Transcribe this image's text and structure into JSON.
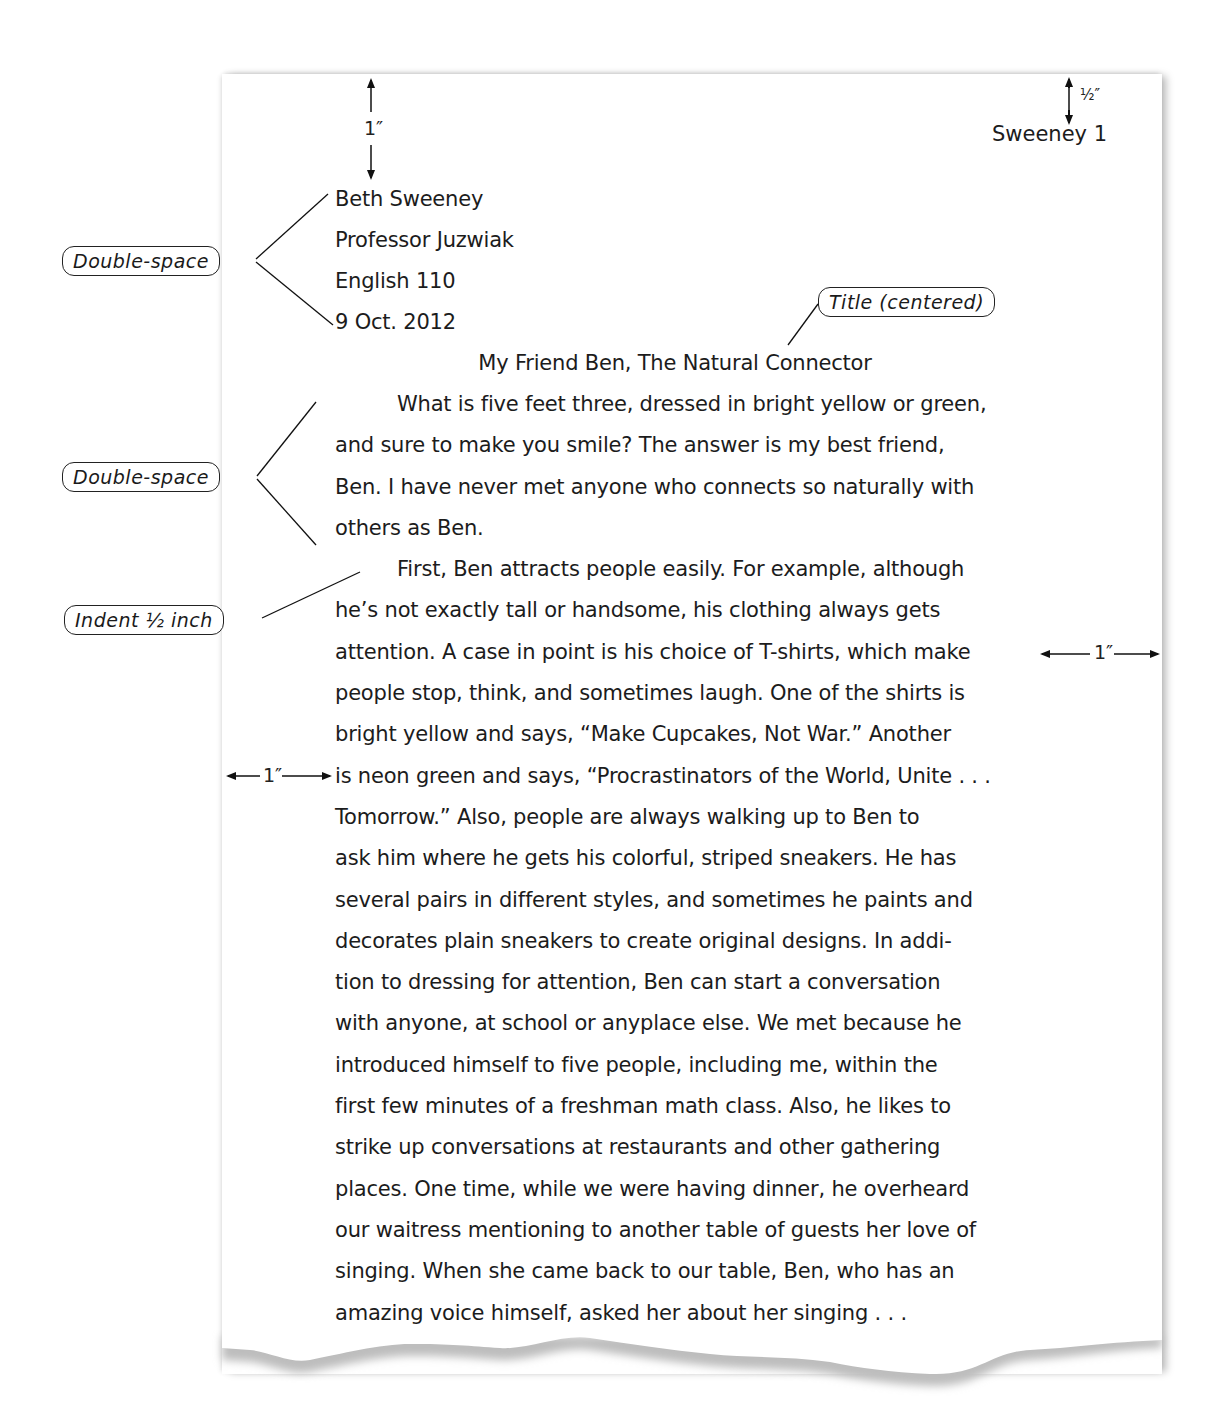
{
  "page_header": {
    "running_head": "Sweeney 1"
  },
  "heading": {
    "lines": [
      "Beth Sweeney",
      "Professor Juzwiak",
      "English 110",
      "9 Oct. 2012"
    ]
  },
  "title": "My Friend Ben, The Natural Connector",
  "body": {
    "lines": [
      "What is five feet three, dressed in bright yellow or green,",
      "and sure to make you smile? The answer is my best friend,",
      "Ben. I have never met anyone who connects so naturally with",
      "others as Ben.",
      "First, Ben attracts people easily. For example, although",
      "he’s not exactly tall or handsome, his clothing always gets",
      "attention. A case in point is his choice of T-shirts, which make",
      "people stop, think, and sometimes laugh. One of the shirts is",
      "bright yellow and says, “Make Cupcakes, Not War.” Another",
      "is neon green and says, “Procrastinators of the World, Unite . . .",
      "Tomorrow.” Also, people are always walking up to Ben to",
      "ask him where he gets his colorful, striped sneakers. He has",
      "several pairs in different styles, and sometimes he paints and",
      "decorates plain sneakers to create original designs. In addi-",
      "tion to dressing for attention, Ben can start a conversation",
      "with anyone, at school or anyplace else. We met because he",
      "introduced himself to five people, including me, within the",
      "first few minutes of a freshman math class. Also, he likes to",
      "strike up conversations at restaurants and other gathering",
      "places. One time, while we were having dinner, he overheard",
      "our waitress mentioning to another table of guests her love of",
      "singing. When she came back to our table, Ben, who has an",
      "amazing voice himself, asked her about her singing . . ."
    ]
  },
  "annotations": {
    "double_space_heading": "Double-space",
    "title_centered": "Title (centered)",
    "double_space_body": "Double-space",
    "indent": "Indent ½ inch",
    "top_margin": "1″",
    "header_margin": "½″",
    "right_margin": "1″",
    "left_margin": "1″"
  }
}
